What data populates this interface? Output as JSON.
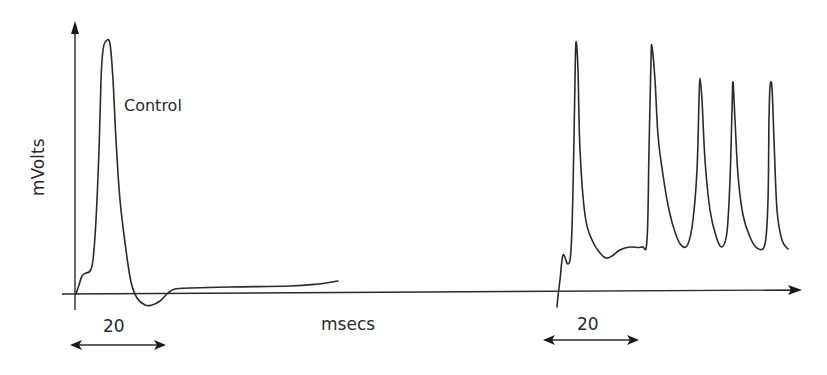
{
  "chart_data": {
    "type": "line",
    "title": "",
    "xlabel": "msecs",
    "ylabel": "mVolts",
    "grid": false,
    "legend": null,
    "annotations": [
      "Control",
      "20",
      "20"
    ],
    "panels": [
      {
        "name": "control",
        "label": "Control",
        "scale_bar": {
          "label": "20",
          "units": "msecs"
        },
        "description": "Single action potential followed by brief afterhyperpolarization and steady baseline",
        "points": [
          [
            76,
            294
          ],
          [
            79,
            285
          ],
          [
            82,
            276
          ],
          [
            86,
            273
          ],
          [
            90,
            271
          ],
          [
            93,
            260
          ],
          [
            96,
            220
          ],
          [
            99,
            150
          ],
          [
            101,
            80
          ],
          [
            103,
            50
          ],
          [
            106,
            41
          ],
          [
            110,
            44
          ],
          [
            113,
            80
          ],
          [
            116,
            140
          ],
          [
            120,
            200
          ],
          [
            126,
            250
          ],
          [
            131,
            282
          ],
          [
            137,
            298
          ],
          [
            145,
            305
          ],
          [
            152,
            305
          ],
          [
            160,
            301
          ],
          [
            168,
            293
          ],
          [
            175,
            289
          ],
          [
            190,
            288
          ],
          [
            230,
            287
          ],
          [
            290,
            286
          ],
          [
            318,
            284
          ],
          [
            338,
            281
          ]
        ]
      },
      {
        "name": "treated",
        "label": "",
        "scale_bar": {
          "label": "20",
          "units": "msecs"
        },
        "description": "Repetitive firing: five spikes riding on a depolarized plateau",
        "points": [
          [
            557,
            307
          ],
          [
            558,
            296
          ],
          [
            560,
            280
          ],
          [
            563,
            255
          ],
          [
            568,
            264
          ],
          [
            571,
            250
          ],
          [
            573,
            190
          ],
          [
            575,
            80
          ],
          [
            576,
            42
          ],
          [
            578,
            70
          ],
          [
            580,
            150
          ],
          [
            585,
            215
          ],
          [
            592,
            240
          ],
          [
            600,
            253
          ],
          [
            606,
            258
          ],
          [
            612,
            256
          ],
          [
            620,
            250
          ],
          [
            630,
            247
          ],
          [
            642,
            247
          ],
          [
            647,
            240
          ],
          [
            649,
            150
          ],
          [
            651,
            60
          ],
          [
            652,
            47
          ],
          [
            655,
            80
          ],
          [
            658,
            135
          ],
          [
            663,
            175
          ],
          [
            669,
            210
          ],
          [
            676,
            235
          ],
          [
            682,
            246
          ],
          [
            688,
            244
          ],
          [
            693,
            220
          ],
          [
            697,
            170
          ],
          [
            699,
            100
          ],
          [
            700,
            78
          ],
          [
            702,
            100
          ],
          [
            705,
            160
          ],
          [
            710,
            210
          ],
          [
            716,
            236
          ],
          [
            722,
            247
          ],
          [
            727,
            232
          ],
          [
            730,
            180
          ],
          [
            732,
            110
          ],
          [
            733,
            82
          ],
          [
            735,
            120
          ],
          [
            738,
            175
          ],
          [
            743,
            215
          ],
          [
            750,
            237
          ],
          [
            757,
            248
          ],
          [
            765,
            244
          ],
          [
            768,
            200
          ],
          [
            769,
            120
          ],
          [
            770,
            87
          ],
          [
            772,
            88
          ],
          [
            774,
            140
          ],
          [
            777,
            210
          ],
          [
            782,
            240
          ],
          [
            788,
            249
          ]
        ]
      }
    ]
  },
  "labels": {
    "y_axis": "mVolts",
    "x_axis": "msecs",
    "control": "Control",
    "scale_left": "20",
    "scale_right": "20"
  },
  "colors": {
    "ink": "#2a2a2a",
    "background": "#ffffff"
  }
}
